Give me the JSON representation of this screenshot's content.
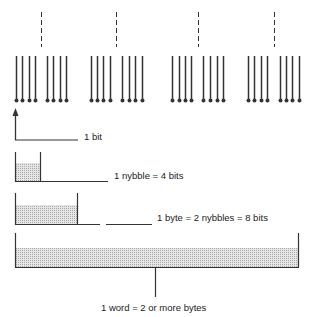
{
  "diagram": {
    "colors": {
      "ink": "#333333",
      "shade": "#d9d9d9"
    },
    "bit_line_groups": [
      {
        "dashed_x": 41,
        "lines_x": [
          16,
          22,
          29,
          35,
          47,
          53,
          60,
          66
        ]
      },
      {
        "dashed_x": 116,
        "lines_x": [
          91,
          97,
          103,
          110,
          122,
          129,
          135,
          142
        ]
      },
      {
        "dashed_x": 198,
        "lines_x": [
          172,
          179,
          185,
          191,
          203,
          210,
          217,
          223
        ]
      },
      {
        "dashed_x": 274,
        "lines_x": [
          248,
          254,
          261,
          267,
          280,
          286,
          292,
          299
        ]
      }
    ],
    "labels": {
      "bit": "1 bit",
      "nybble": "1 nybble = 4 bits",
      "byte": "1 byte = 2 nybbles = 8 bits",
      "word": "1 word = 2 or more bytes"
    }
  }
}
